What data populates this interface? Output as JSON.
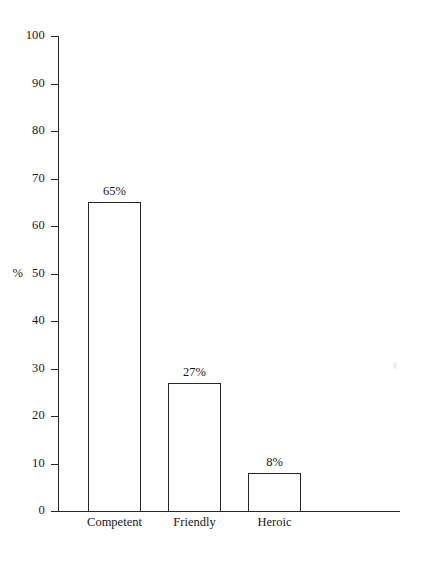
{
  "chart_data": {
    "type": "bar",
    "title": "",
    "subtitle": "",
    "xlabel": "",
    "ylabel": "%",
    "categories": [
      "Competent",
      "Friendly",
      "Heroic"
    ],
    "values": [
      65,
      27,
      8
    ],
    "value_labels": [
      "65%",
      "27%",
      "8%"
    ],
    "ylim": [
      0,
      100
    ],
    "ytick_labels": [
      "0",
      "10",
      "20",
      "30",
      "40",
      "50",
      "60",
      "70",
      "80",
      "90",
      "100"
    ],
    "ytick_values": [
      0,
      10,
      20,
      30,
      40,
      50,
      60,
      70,
      80,
      90,
      100
    ],
    "unit_marker": "%",
    "unit_marker_at_tick": 50,
    "grid": false,
    "legend": null,
    "bar_fill": "#ffffff",
    "bar_stroke": "#262626",
    "axis_color": "#262626",
    "background": "#ffffff",
    "text_color": "#1a1a1a"
  }
}
